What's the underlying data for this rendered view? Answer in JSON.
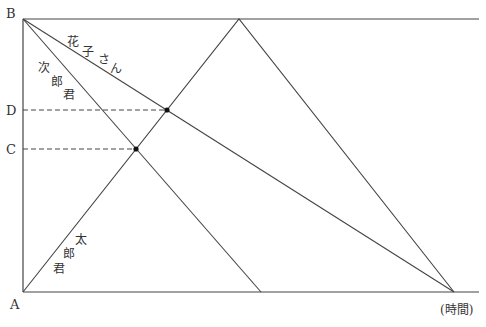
{
  "diagram": {
    "type": "distance-time diagram",
    "points": {
      "A": {
        "label": "A",
        "x": 23,
        "y": 292
      },
      "B": {
        "label": "B",
        "x": 23,
        "y": 19
      },
      "C": {
        "label": "C",
        "x": 23,
        "y": 149
      },
      "D": {
        "label": "D",
        "x": 23,
        "y": 110
      }
    },
    "axis": {
      "time_label": "(時間)"
    },
    "people": [
      {
        "name": "太郎君",
        "chars": [
          "太",
          "郎",
          "君"
        ],
        "path": "A → apex at B-level → back to A-level"
      },
      {
        "name": "次郎君",
        "chars": [
          "次",
          "郎",
          "君"
        ],
        "path": "B → A-level"
      },
      {
        "name": "花子さん",
        "chars": [
          "花",
          "子",
          "さ",
          "ん"
        ],
        "path": "B → A-level"
      }
    ],
    "intersections": [
      {
        "with": "D",
        "x": 167,
        "y": 110
      },
      {
        "with": "C",
        "x": 136,
        "y": 149
      }
    ],
    "colors": {
      "line": "#333333",
      "text": "#333333"
    }
  }
}
